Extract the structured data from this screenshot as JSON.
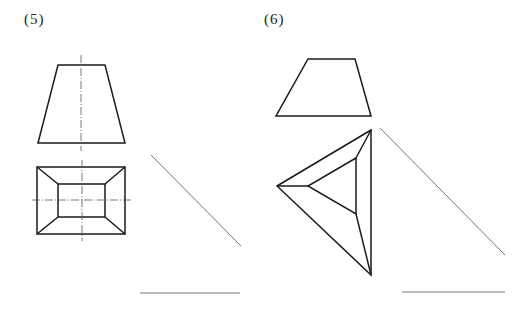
{
  "problems": [
    {
      "label": "(5)",
      "description": "Frustum of a rectangular pyramid: front view trapezoid and top view rectangle with inner rectangle, with centerlines; 45-degree auxiliary line and baseline for drawing side view"
    },
    {
      "label": "(6)",
      "description": "Frustum of a triangular pyramid: front view trapezoid and top view triangle with inner triangle; 45-degree auxiliary line and baseline for drawing side view"
    }
  ],
  "colors": {
    "stroke": "#1a1a1a",
    "aux_stroke": "#777777",
    "background": "#ffffff"
  }
}
